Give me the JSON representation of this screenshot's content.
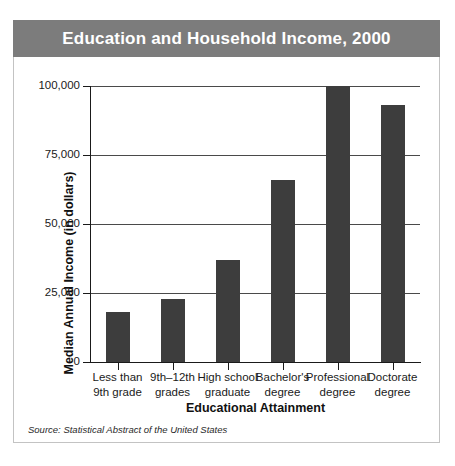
{
  "figure": {
    "title": "Education and Household Income, 2000",
    "source_note": "Source: Statistical Abstract of the United States",
    "banner_color": "#7c7c7c",
    "bar_color": "#3d3d3d",
    "title_text_color": "#ffffff",
    "background_color": "#ffffff",
    "border_color": "#c3c3c3"
  },
  "chart_data": {
    "type": "bar",
    "title": "Education and Household Income, 2000",
    "xlabel": "Educational Attainment",
    "ylabel": "Median Annual Income (in dollars)",
    "categories": [
      "Less than 9th grade",
      "9th–12th grades",
      "High school graduate",
      "Bachelor's degree",
      "Professional degree",
      "Doctorate degree"
    ],
    "category_lines": [
      [
        "Less than",
        "9th grade"
      ],
      [
        "9th–12th",
        "grades"
      ],
      [
        "High school",
        "graduate"
      ],
      [
        "Bachelor's",
        "degree"
      ],
      [
        "Professional",
        "degree"
      ],
      [
        "Doctorate",
        "degree"
      ]
    ],
    "values": [
      18000,
      23000,
      37000,
      66000,
      100000,
      93000
    ],
    "ylim": [
      0,
      100000
    ],
    "yticks": [
      0,
      25000,
      50000,
      75000,
      100000
    ],
    "ytick_labels": [
      "0",
      "25,000",
      "50,000",
      "75,000",
      "100,000"
    ],
    "grid": true,
    "legend": false,
    "series_color": "#3d3d3d"
  }
}
